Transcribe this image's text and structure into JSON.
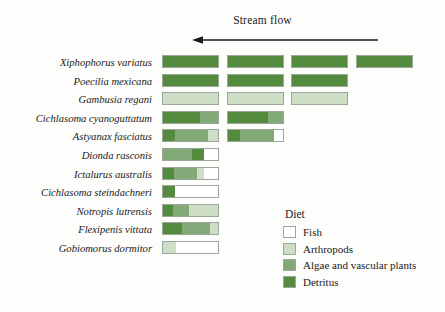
{
  "header": {
    "stream_flow_label": "Stream flow",
    "arrow_direction": "left",
    "arrow_icon": "left-arrow-icon"
  },
  "legend": {
    "title": "Diet",
    "items": [
      {
        "label": "Fish",
        "color": "#ffffff"
      },
      {
        "label": "Arthropods",
        "color": "#cdddc6"
      },
      {
        "label": "Algae and vascular plants",
        "color": "#84a978"
      },
      {
        "label": "Detritus",
        "color": "#558b3f"
      }
    ]
  },
  "colors": {
    "fish": "#ffffff",
    "arthropods": "#cdddc6",
    "algae": "#84a978",
    "detritus": "#558b3f",
    "border": "#9aa79a",
    "text": "#1a1a1a",
    "background": "#fdfdfb"
  },
  "chart_data": {
    "type": "bar",
    "title": "Stream flow",
    "xlabel": "",
    "ylabel": "",
    "orientation": "horizontal",
    "stacked": true,
    "grid": false,
    "legend_position": "bottom-right",
    "axis_note": "Columns correspond to four sampling sites along the stream; flow is from right to left.",
    "series": [
      {
        "name": "Fish",
        "color": "#ffffff"
      },
      {
        "name": "Arthropods",
        "color": "#cdddc6"
      },
      {
        "name": "Algae and vascular plants",
        "color": "#84a978"
      },
      {
        "name": "Detritus",
        "color": "#558b3f"
      }
    ],
    "site_columns": [
      {
        "index": 1,
        "left": 0,
        "width": 57
      },
      {
        "index": 2,
        "left": 65,
        "width": 57
      },
      {
        "index": 3,
        "left": 129,
        "width": 57
      },
      {
        "index": 4,
        "left": 194,
        "width": 57
      }
    ],
    "categories": [
      "Xiphophorus variatus",
      "Poecilia mexicana",
      "Gambusia regani",
      "Cichlasoma cyanoguttatum",
      "Astyanax fasciatus",
      "Dionda rasconis",
      "Ictalurus australis",
      "Cichlasoma steindachneri",
      "Notropis lutrensis",
      "Flexipenis vittata",
      "Gobiomorus dormitor"
    ],
    "rows": [
      {
        "species": "Xiphophorus variatus",
        "bars": [
          {
            "site": 1,
            "segments": [
              {
                "diet": "Detritus",
                "pct": 100
              }
            ]
          },
          {
            "site": 2,
            "segments": [
              {
                "diet": "Detritus",
                "pct": 100
              }
            ]
          },
          {
            "site": 3,
            "segments": [
              {
                "diet": "Detritus",
                "pct": 100
              }
            ]
          },
          {
            "site": 4,
            "segments": [
              {
                "diet": "Detritus",
                "pct": 100
              }
            ]
          }
        ]
      },
      {
        "species": "Poecilia mexicana",
        "bars": [
          {
            "site": 1,
            "segments": [
              {
                "diet": "Detritus",
                "pct": 100
              }
            ]
          },
          {
            "site": 2,
            "segments": [
              {
                "diet": "Detritus",
                "pct": 100
              }
            ]
          },
          {
            "site": 3,
            "segments": [
              {
                "diet": "Detritus",
                "pct": 100
              }
            ]
          }
        ]
      },
      {
        "species": "Gambusia regani",
        "bars": [
          {
            "site": 1,
            "segments": [
              {
                "diet": "Arthropods",
                "pct": 100
              }
            ]
          },
          {
            "site": 2,
            "segments": [
              {
                "diet": "Arthropods",
                "pct": 100
              }
            ]
          },
          {
            "site": 3,
            "segments": [
              {
                "diet": "Arthropods",
                "pct": 100
              }
            ]
          }
        ]
      },
      {
        "species": "Cichlasoma cyanoguttatum",
        "bars": [
          {
            "site": 1,
            "segments": [
              {
                "diet": "Detritus",
                "pct": 68
              },
              {
                "diet": "Algae and vascular plants",
                "pct": 32
              }
            ]
          },
          {
            "site": 2,
            "segments": [
              {
                "diet": "Detritus",
                "pct": 72
              },
              {
                "diet": "Algae and vascular plants",
                "pct": 28
              }
            ]
          }
        ]
      },
      {
        "species": "Astyanax fasciatus",
        "bars": [
          {
            "site": 1,
            "segments": [
              {
                "diet": "Detritus",
                "pct": 22
              },
              {
                "diet": "Algae and vascular plants",
                "pct": 60
              },
              {
                "diet": "Arthropods",
                "pct": 18
              }
            ]
          },
          {
            "site": 2,
            "segments": [
              {
                "diet": "Detritus",
                "pct": 22
              },
              {
                "diet": "Algae and vascular plants",
                "pct": 62
              },
              {
                "diet": "Fish",
                "pct": 16
              }
            ]
          }
        ]
      },
      {
        "species": "Dionda rasconis",
        "bars": [
          {
            "site": 1,
            "segments": [
              {
                "diet": "Algae and vascular plants",
                "pct": 52
              },
              {
                "diet": "Detritus",
                "pct": 22
              },
              {
                "diet": "Fish",
                "pct": 26
              }
            ]
          }
        ]
      },
      {
        "species": "Ictalurus australis",
        "bars": [
          {
            "site": 1,
            "segments": [
              {
                "diet": "Detritus",
                "pct": 20
              },
              {
                "diet": "Algae and vascular plants",
                "pct": 42
              },
              {
                "diet": "Arthropods",
                "pct": 12
              },
              {
                "diet": "Fish",
                "pct": 26
              }
            ]
          }
        ]
      },
      {
        "species": "Cichlasoma steindachneri",
        "bars": [
          {
            "site": 1,
            "segments": [
              {
                "diet": "Detritus",
                "pct": 22
              },
              {
                "diet": "Fish",
                "pct": 78
              }
            ]
          }
        ]
      },
      {
        "species": "Notropis lutrensis",
        "bars": [
          {
            "site": 1,
            "segments": [
              {
                "diet": "Detritus",
                "pct": 18
              },
              {
                "diet": "Algae and vascular plants",
                "pct": 30
              },
              {
                "diet": "Arthropods",
                "pct": 52
              }
            ]
          }
        ]
      },
      {
        "species": "Flexipenis vittata",
        "bars": [
          {
            "site": 1,
            "segments": [
              {
                "diet": "Detritus",
                "pct": 34
              },
              {
                "diet": "Algae and vascular plants",
                "pct": 52
              },
              {
                "diet": "Arthropods",
                "pct": 14
              }
            ]
          }
        ]
      },
      {
        "species": "Gobiomorus dormitor",
        "bars": [
          {
            "site": 1,
            "segments": [
              {
                "diet": "Arthropods",
                "pct": 24
              },
              {
                "diet": "Fish",
                "pct": 76
              }
            ]
          }
        ]
      }
    ]
  }
}
